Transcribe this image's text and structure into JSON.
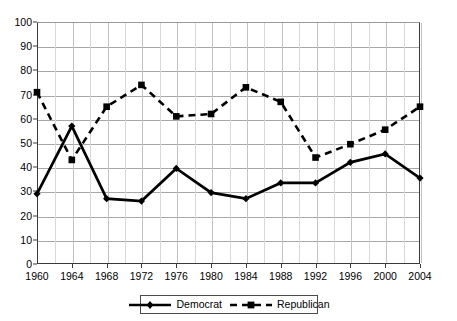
{
  "chart_data": {
    "type": "line",
    "title": "",
    "subtitle": "",
    "xlabel": "",
    "ylabel": "",
    "categories": [
      "1960",
      "1964",
      "1968",
      "1972",
      "1976",
      "1980",
      "1984",
      "1988",
      "1992",
      "1996",
      "2000",
      "2004"
    ],
    "x": [
      1960,
      1964,
      1968,
      1972,
      1976,
      1980,
      1984,
      1988,
      1992,
      1996,
      2000,
      2004
    ],
    "series": [
      {
        "name": "Democrat",
        "marker": "diamond",
        "line_style": "solid",
        "color": "#000000",
        "values": [
          29,
          57,
          27,
          26,
          39.5,
          29.5,
          27,
          33.5,
          33.5,
          42,
          45.5,
          35.5
        ]
      },
      {
        "name": "Republican",
        "marker": "square",
        "line_style": "dashed",
        "color": "#000000",
        "values": [
          71,
          43,
          65,
          74,
          61,
          62,
          73,
          67,
          44,
          49.5,
          55.5,
          65
        ]
      }
    ],
    "ylim": [
      0,
      100
    ],
    "ytick_values": [
      0,
      10,
      20,
      30,
      40,
      50,
      60,
      70,
      80,
      90,
      100
    ],
    "ytick_labels": [
      "0",
      "10",
      "20",
      "30",
      "40",
      "50",
      "60",
      "70",
      "80",
      "90",
      "100"
    ],
    "xtick_labels": [
      "1960",
      "1964",
      "1968",
      "1972",
      "1976",
      "1980",
      "1984",
      "1988",
      "1992",
      "1996",
      "2000",
      "2004"
    ],
    "grid": true,
    "grid_horizontal": true,
    "grid_vertical": true,
    "legend_position": "bottom-center",
    "legend_entries": [
      "Democrat",
      "Republican"
    ]
  },
  "legend": {
    "democrat_label": "Democrat",
    "republican_label": "Republican"
  }
}
